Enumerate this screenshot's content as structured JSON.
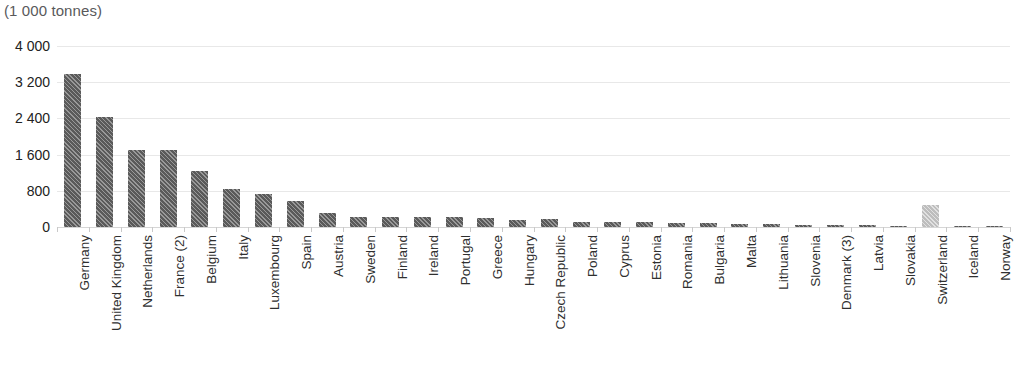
{
  "caption": "(1 000 tonnes)",
  "colors": {
    "bar_dark": "#5a5a5a",
    "bar_light": "#bdbdbd",
    "gridline": "#e8e8e8",
    "axis": "#d6d6d6",
    "caption_text": "#59595b",
    "tick_text": "#222222"
  },
  "chart_data": {
    "type": "bar",
    "title": "",
    "subtitle": "",
    "xlabel": "",
    "ylabel": "(1 000 tonnes)",
    "ylim": [
      0,
      4000
    ],
    "yticks": [
      "0",
      "800",
      "1 600",
      "2 400",
      "3 200",
      "4 000"
    ],
    "ytick_values": [
      0,
      800,
      1600,
      2400,
      3200,
      4000
    ],
    "grid": true,
    "legend": "none",
    "categories": [
      "Germany",
      "United Kingdom",
      "Netherlands",
      "France (2)",
      "Belgium",
      "Italy",
      "Luxembourg",
      "Spain",
      "Austria",
      "Sweden",
      "Finland",
      "Ireland",
      "Portugal",
      "Greece",
      "Hungary",
      "Czech Republic",
      "Poland",
      "Cyprus",
      "Estonia",
      "Romania",
      "Bulgaria",
      "Malta",
      "Lithuania",
      "Slovenia",
      "Denmark (3)",
      "Latvia",
      "Slovakia",
      "Switzerland",
      "Iceland",
      "Norway"
    ],
    "values": [
      3390,
      2440,
      1700,
      1700,
      1230,
      830,
      730,
      580,
      300,
      230,
      230,
      220,
      220,
      200,
      150,
      180,
      120,
      110,
      100,
      90,
      80,
      70,
      60,
      50,
      50,
      40,
      30,
      490,
      25,
      10
    ],
    "highlight": {
      "category": "Switzerland",
      "style": "light-hatched"
    },
    "bar_style": "diagonal-hatched"
  }
}
